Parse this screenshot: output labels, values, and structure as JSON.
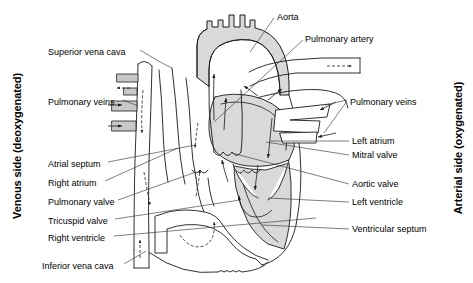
{
  "figure": {
    "background_color": "#ffffff",
    "line_color": "#1a1a1a",
    "oxygenated_fill": "#d9d9d9",
    "deoxygenated_fill": "#ffffff",
    "vessel_fill": "#c8c8c8"
  },
  "side_labels": {
    "left": "Venous side (deoxygenated)",
    "right": "Arterial side (oxygenated)"
  },
  "labels_left": [
    {
      "id": "superior-vena-cava",
      "text": "Superior vena cava",
      "x": 48,
      "y": 47
    },
    {
      "id": "pulmonary-veins-left",
      "text": "Pulmonary veins",
      "x": 48,
      "y": 97
    },
    {
      "id": "atrial-septum",
      "text": "Atrial septum",
      "x": 48,
      "y": 159
    },
    {
      "id": "right-atrium",
      "text": "Right atrium",
      "x": 48,
      "y": 178
    },
    {
      "id": "pulmonary-valve",
      "text": "Pulmonary valve",
      "x": 48,
      "y": 197
    },
    {
      "id": "tricuspid-valve",
      "text": "Tricuspid valve",
      "x": 48,
      "y": 216
    },
    {
      "id": "right-ventricle",
      "text": "Right ventricle",
      "x": 48,
      "y": 233
    },
    {
      "id": "inferior-vena-cava",
      "text": "Inferior vena cava",
      "x": 48,
      "y": 261
    }
  ],
  "labels_right": [
    {
      "id": "aorta",
      "text": "Aorta",
      "x": 277,
      "y": 12
    },
    {
      "id": "pulmonary-artery",
      "text": "Pulmonary artery",
      "x": 305,
      "y": 34
    },
    {
      "id": "pulmonary-veins-right",
      "text": "Pulmonary veins",
      "x": 350,
      "y": 97
    },
    {
      "id": "left-atrium",
      "text": "Left atrium",
      "x": 352,
      "y": 138
    },
    {
      "id": "mitral-valve",
      "text": "Mitral valve",
      "x": 352,
      "y": 152
    },
    {
      "id": "aortic-valve",
      "text": "Aortic valve",
      "x": 352,
      "y": 181
    },
    {
      "id": "left-ventricle",
      "text": "Left ventricle",
      "x": 352,
      "y": 199
    },
    {
      "id": "ventricular-septum",
      "text": "Ventricular septum",
      "x": 352,
      "y": 226
    }
  ],
  "flow_arrows": {
    "deoxygenated_style": "dashed",
    "oxygenated_style": "solid",
    "description": "Arrows indicate direction of blood flow through chambers and great vessels"
  }
}
